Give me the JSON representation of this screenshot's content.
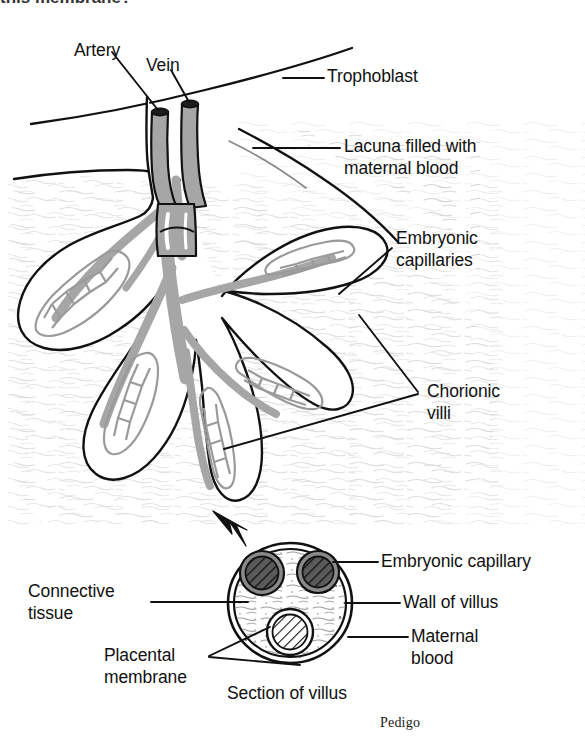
{
  "figure": {
    "kind": "anatomical-diagram",
    "credit": "Pedigo",
    "cut_off_header": "this membrane?",
    "background_color": "#ffffff",
    "ink_color": "#111111",
    "vessel_fill_color": "#a6a6a6",
    "capillary_mesh_color": "#9a9a9a",
    "maternal_blood_texture_color": "#d8d8d8",
    "dark_capillary_fill": "#4a4a4a"
  },
  "labels": {
    "artery": "Artery",
    "vein": "Vein",
    "trophoblast": "Trophoblast",
    "lacuna_line1": "Lacuna filled with",
    "lacuna_line2": "maternal blood",
    "embryonic_capillaries_line1": "Embryonic",
    "embryonic_capillaries_line2": "capillaries",
    "chorionic_villi_line1": "Chorionic",
    "chorionic_villi_line2": "villi",
    "connective_tissue_line1": "Connective",
    "connective_tissue_line2": "tissue",
    "placental_membrane_line1": "Placental",
    "placental_membrane_line2": "membrane",
    "embryonic_capillary": "Embryonic capillary",
    "wall_of_villus": "Wall of villus",
    "maternal_blood_line1": "Maternal",
    "maternal_blood_line2": "blood",
    "section_of_villus": "Section of villus"
  },
  "cross_section": {
    "center_x": 290,
    "center_y": 603,
    "outer_radius_x": 62,
    "outer_radius_y": 60,
    "capillaries": [
      {
        "name": "upper-left-capillary",
        "cx": 262,
        "cy": 573,
        "r": 21,
        "shade": "dark"
      },
      {
        "name": "upper-right-capillary",
        "cx": 318,
        "cy": 572,
        "r": 20,
        "shade": "dark"
      },
      {
        "name": "lower-center-capillary",
        "cx": 290,
        "cy": 632,
        "r": 22,
        "shade": "light"
      }
    ]
  },
  "villi_tips": [
    {
      "name": "villus-tip-left-upper"
    },
    {
      "name": "villus-tip-left-lower"
    },
    {
      "name": "villus-tip-center-lower"
    },
    {
      "name": "villus-tip-right-inner"
    },
    {
      "name": "villus-tip-right-outer"
    }
  ]
}
